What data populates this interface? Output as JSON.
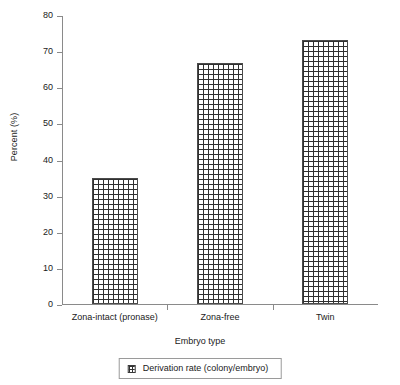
{
  "chart_data": {
    "type": "bar",
    "title": "",
    "subtitle": "",
    "categories": [
      "Zona-intact (pronase)",
      "Zona-free",
      "Twin"
    ],
    "values": [
      35,
      66.7,
      73
    ],
    "series": [
      {
        "name": "Derivation rate (colony/embryo)",
        "values": [
          35,
          66.7,
          73
        ]
      }
    ],
    "xlabel": "Embryo type",
    "ylabel": "Percent (%)",
    "ylim": [
      0,
      80
    ],
    "ytick_values": [
      0,
      10,
      20,
      30,
      40,
      50,
      60,
      70,
      80
    ],
    "ytick_labels": [
      "0",
      "10",
      "20",
      "30",
      "40",
      "50",
      "60",
      "70",
      "80"
    ],
    "grid": false,
    "legend_position": "bottom",
    "legend_entries": [
      "Derivation rate (colony/embryo)"
    ],
    "bar_fill": "crosshatch-grid",
    "bar_edge_color": "#4a4a4a",
    "axis_color": "#8a8a8a",
    "background_color": "#ffffff"
  }
}
